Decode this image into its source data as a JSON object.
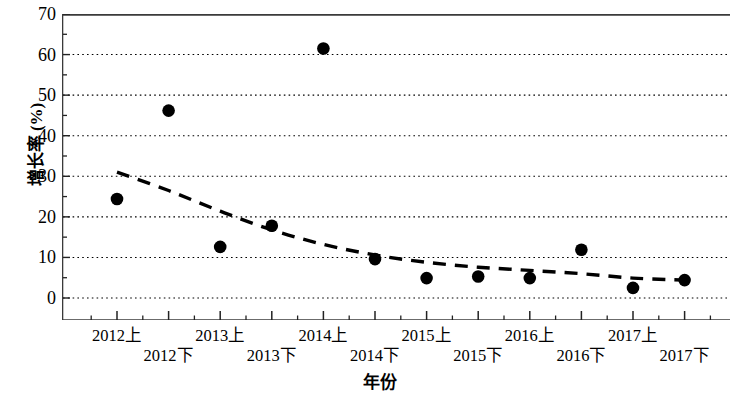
{
  "chart_data": {
    "type": "scatter",
    "title": "",
    "xlabel": "年份",
    "ylabel": "增长率 (%)",
    "ylim": [
      0,
      70
    ],
    "yticks": [
      0,
      10,
      20,
      30,
      40,
      50,
      60,
      70
    ],
    "ytick_labels": [
      "0",
      "10",
      "20",
      "30",
      "40",
      "50",
      "60",
      "70"
    ],
    "grid": "horizontal-dotted",
    "legend": "none",
    "categories": [
      "2012上",
      "2012下",
      "2013上",
      "2013下",
      "2014上",
      "2014下",
      "2015上",
      "2015下",
      "2016上",
      "2016下",
      "2017上",
      "2017下"
    ],
    "values": [
      24.4,
      46.2,
      12.6,
      17.8,
      61.5,
      9.6,
      4.9,
      5.3,
      4.9,
      11.9,
      2.5,
      4.4
    ],
    "series": [
      {
        "name": "增长率",
        "marker": "filled-circle",
        "color": "#000000",
        "values": [
          24.4,
          46.2,
          12.6,
          17.8,
          61.5,
          9.6,
          4.9,
          5.3,
          4.9,
          11.9,
          2.5,
          4.4
        ]
      },
      {
        "name": "趋势线",
        "type": "trend-dashed",
        "color": "#000000",
        "x_start": "2012上",
        "x_end": "2017下",
        "y_start": 31.0,
        "y_end": 4.4,
        "control_points": [
          [
            0.0,
            31.0
          ],
          [
            1.0,
            26.5
          ],
          [
            2.0,
            21.4
          ],
          [
            3.0,
            16.8
          ],
          [
            4.0,
            13.2
          ],
          [
            5.0,
            10.6
          ],
          [
            6.0,
            8.8
          ],
          [
            7.0,
            7.6
          ],
          [
            8.0,
            6.8
          ],
          [
            9.0,
            6.0
          ],
          [
            10.0,
            4.9
          ],
          [
            11.0,
            4.4
          ]
        ]
      }
    ]
  }
}
